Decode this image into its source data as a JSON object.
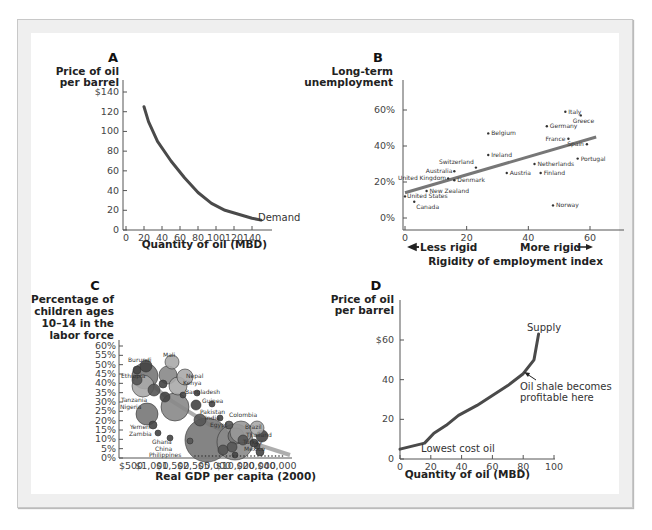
{
  "chart_data": [
    {
      "panel": "A",
      "type": "line",
      "ylabel": "Price of oil per barrel",
      "xlabel": "Quantity of oil (MBD)",
      "yticks": [
        "$140",
        "120",
        "100",
        "80",
        "60",
        "40",
        "20",
        "0"
      ],
      "xticks": [
        "0",
        "20",
        "40",
        "60",
        "80",
        "100",
        "120",
        "140"
      ],
      "ylim": [
        0,
        140
      ],
      "xlim": [
        0,
        160
      ],
      "series": [
        {
          "name": "Demand",
          "x": [
            20,
            25,
            35,
            50,
            65,
            80,
            95,
            110,
            125,
            140,
            150
          ],
          "y": [
            125,
            110,
            90,
            70,
            53,
            38,
            27,
            20,
            16,
            12,
            10
          ]
        }
      ],
      "curve_label": "Demand"
    },
    {
      "panel": "B",
      "type": "scatter",
      "ylabel": "Long-term unemployment",
      "xlabel": "Rigidity of employment index",
      "yticks": [
        "60%",
        "40%",
        "20%",
        "0%"
      ],
      "xticks": [
        "0",
        "20",
        "40",
        "60"
      ],
      "ylim": [
        0,
        70
      ],
      "xlim": [
        0,
        65
      ],
      "left_arrow_label": "Less rigid",
      "right_arrow_label": "More rigid",
      "trendline": {
        "x": [
          0,
          62
        ],
        "y": [
          14,
          45
        ]
      },
      "points": [
        {
          "name": "Italy",
          "x": 52,
          "y": 59
        },
        {
          "name": "Greece",
          "x": 57,
          "y": 57
        },
        {
          "name": "Germany",
          "x": 46,
          "y": 51
        },
        {
          "name": "Belgium",
          "x": 27,
          "y": 47
        },
        {
          "name": "France",
          "x": 53,
          "y": 44
        },
        {
          "name": "Spain",
          "x": 59,
          "y": 41
        },
        {
          "name": "Ireland",
          "x": 27,
          "y": 35
        },
        {
          "name": "Portugal",
          "x": 56,
          "y": 33
        },
        {
          "name": "Switzerland",
          "x": 23,
          "y": 28
        },
        {
          "name": "Netherlands",
          "x": 42,
          "y": 30
        },
        {
          "name": "Australia",
          "x": 16,
          "y": 26
        },
        {
          "name": "Austria",
          "x": 33,
          "y": 25
        },
        {
          "name": "Finland",
          "x": 44,
          "y": 25
        },
        {
          "name": "United Kingdom",
          "x": 14,
          "y": 22
        },
        {
          "name": "Denmark",
          "x": 16,
          "y": 21
        },
        {
          "name": "New Zealand",
          "x": 7,
          "y": 15
        },
        {
          "name": "United States",
          "x": 0,
          "y": 12
        },
        {
          "name": "Canada",
          "x": 3,
          "y": 9
        },
        {
          "name": "Norway",
          "x": 48,
          "y": 7
        }
      ]
    },
    {
      "panel": "C",
      "type": "scatter",
      "ylabel": "Percentage of children ages 10–14 in the labor force",
      "xlabel": "Real GDP per capita (2000)",
      "yticks": [
        "60%",
        "55%",
        "50%",
        "45%",
        "40%",
        "35%",
        "30%",
        "25%",
        "20%",
        "15%",
        "10%",
        "5%",
        "0%"
      ],
      "xticks": [
        "$500",
        "$1,000",
        "$1,500",
        "$2,500",
        "$5,000",
        "$10,000",
        "$20,000",
        "$40,000"
      ],
      "ylim": [
        0,
        60
      ],
      "labels": [
        "Burundi",
        "Mali",
        "Ethiopia",
        "Nepal",
        "Kenya",
        "Tanzania",
        "Bangladesh",
        "Guinea",
        "Nigeria",
        "Pakistan",
        "India",
        "Yemen",
        "Egypt",
        "Colombia",
        "Zambia",
        "Brazil",
        "Thailand",
        "Ghana",
        "Turkey",
        "China",
        "Mexico",
        "Philippines"
      ]
    },
    {
      "panel": "D",
      "type": "line",
      "ylabel": "Price of oil per barrel",
      "xlabel": "Quantity of oil (MBD)",
      "yticks": [
        "$60",
        "40",
        "20",
        "0"
      ],
      "xticks": [
        "0",
        "20",
        "40",
        "60",
        "80",
        "100"
      ],
      "ylim": [
        0,
        70
      ],
      "xlim": [
        0,
        100
      ],
      "series": [
        {
          "name": "Supply",
          "x": [
            0,
            16,
            22,
            30,
            38,
            50,
            60,
            70,
            80,
            87,
            90
          ],
          "y": [
            5,
            8,
            13,
            17,
            22,
            27,
            32,
            37,
            43,
            50,
            63
          ]
        }
      ],
      "curve_label": "Supply",
      "annotations": [
        "Lowest cost oil",
        "Oil shale becomes profitable here"
      ]
    }
  ],
  "panels": {
    "a": {
      "letter": "A",
      "ylabel1": "Price of oil",
      "ylabel2": "per barrel",
      "xlabel": "Quantity of oil (MBD)",
      "curve": "Demand"
    },
    "b": {
      "letter": "B",
      "ylabel1": "Long-term",
      "ylabel2": "unemployment",
      "xlabel": "Rigidity of employment index",
      "less": "Less rigid",
      "more": "More rigid"
    },
    "c": {
      "letter": "C",
      "ylabel1": "Percentage of",
      "ylabel2": "children ages",
      "ylabel3": "10–14 in the",
      "ylabel4": "labor force",
      "xlabel": "Real GDP per capita (2000)"
    },
    "d": {
      "letter": "D",
      "ylabel1": "Price of oil",
      "ylabel2": "per barrel",
      "xlabel": "Quantity of oil (MBD)",
      "curve": "Supply",
      "ann1": "Lowest cost oil",
      "ann2a": "Oil shale becomes",
      "ann2b": "profitable here"
    }
  }
}
